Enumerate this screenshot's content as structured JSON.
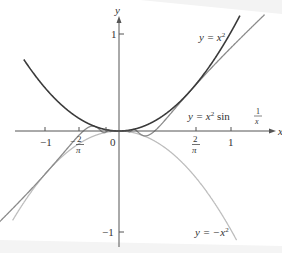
{
  "chart_data": {
    "type": "line",
    "title": "",
    "xlabel": "x",
    "ylabel": "y",
    "xlim": [
      -1.15,
      1.35
    ],
    "ylim": [
      -1.1,
      1.2
    ],
    "grid": false,
    "legend": "inline labels",
    "x_ticks": [
      {
        "value": -1,
        "label": "−1"
      },
      {
        "value": -0.6366,
        "label": "−2/π"
      },
      {
        "value": 0,
        "label": "0"
      },
      {
        "value": 0.6366,
        "label": "2/π"
      },
      {
        "value": 1,
        "label": "1"
      }
    ],
    "y_ticks": [
      {
        "value": 1,
        "label": "1"
      },
      {
        "value": -1,
        "label": "−1"
      }
    ],
    "series": [
      {
        "name": "y = x^2",
        "function": "x^2",
        "domain": [
          -0.85,
          1.08
        ],
        "color": "#3a3a3a"
      },
      {
        "name": "y = x^2 sin(1/x)",
        "function": "x^2*sin(1/x)",
        "domain": [
          -1.15,
          1.3
        ],
        "color": "#8a8a8a"
      },
      {
        "name": "y = -x^2",
        "function": "-x^2",
        "domain": [
          -0.95,
          1.05
        ],
        "color": "#bdbdbd"
      }
    ],
    "annotations": [
      {
        "text": "y = x²",
        "near": [
          0.95,
          0.95
        ]
      },
      {
        "text": "y = x² sin 1/x",
        "near": [
          0.95,
          0.2
        ]
      },
      {
        "text": "y = −x²",
        "near": [
          0.95,
          -1.0
        ]
      }
    ]
  },
  "labels": {
    "x_axis": "x",
    "y_axis": "y",
    "origin": "0",
    "tick_neg1": "−1",
    "tick_neg2pi_num": "2",
    "tick_neg2pi_den": "π",
    "tick_neg_sign": "−",
    "tick_2pi_num": "2",
    "tick_2pi_den": "π",
    "tick_1": "1",
    "ytick_1": "1",
    "ytick_neg1": "−1",
    "curve_x2": "y = x",
    "curve_x2_exp": "2",
    "curve_x2sin_prefix": "y = x",
    "curve_x2sin_exp": "2",
    "curve_x2sin_mid": " sin ",
    "curve_x2sin_num": "1",
    "curve_x2sin_den": "x",
    "curve_negx2": "y = −x",
    "curve_negx2_exp": "2"
  },
  "colors": {
    "x2": "#3a3a3a",
    "x2sin": "#8a8a8a",
    "negx2": "#bdbdbd",
    "axis": "#555555"
  }
}
